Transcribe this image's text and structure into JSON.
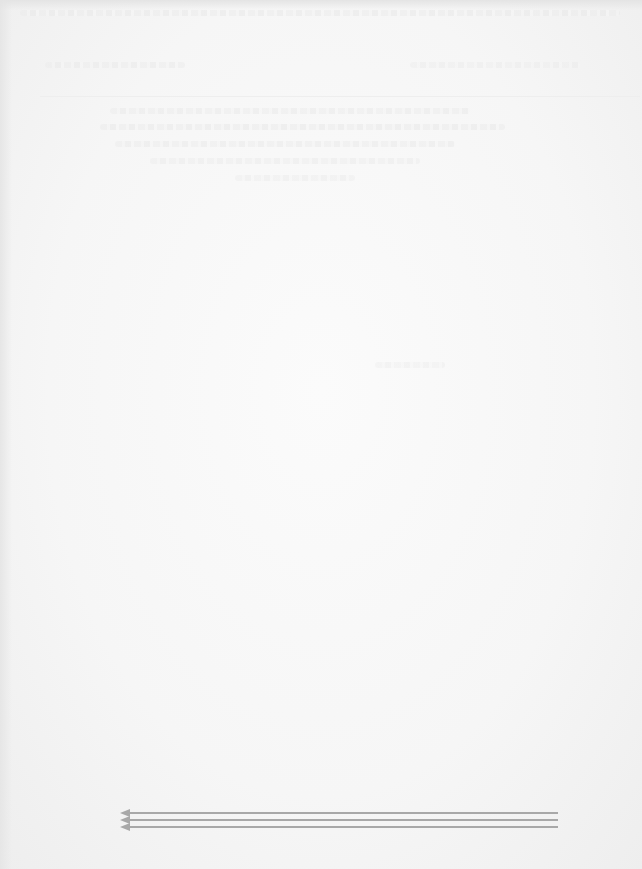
{
  "document": {
    "description": "Washed-out scanned page; text is illegible",
    "arrows": {
      "count": 3,
      "direction": "left",
      "color": "#a8a8a8"
    },
    "colors": {
      "background": "#f7f7f7",
      "arrow": "#a8a8a8"
    }
  }
}
